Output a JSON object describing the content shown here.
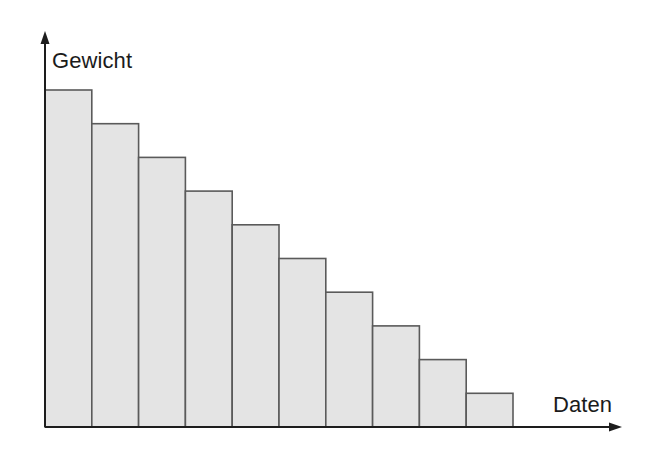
{
  "chart_data": {
    "type": "bar",
    "title": "",
    "subtitle": "",
    "xlabel": "Daten",
    "ylabel": "Gewicht",
    "categories": [
      "1",
      "2",
      "3",
      "4",
      "5",
      "6",
      "7",
      "8",
      "9",
      "10"
    ],
    "values": [
      10,
      9,
      8,
      7,
      6,
      5,
      4,
      3,
      2,
      1
    ],
    "series": [
      {
        "name": "Gewicht",
        "values": [
          10,
          9,
          8,
          7,
          6,
          5,
          4,
          3,
          2,
          1
        ]
      }
    ],
    "ylim": [
      0,
      10.9
    ],
    "xlim": [
      0,
      11.4
    ],
    "grid": false,
    "legend": false,
    "legend_position": "none",
    "tick_labels_x": [],
    "tick_labels_y": [],
    "annotations": [],
    "bar_fill_color": "#e4e4e4",
    "bar_edge_color": "#5a5a5a",
    "axis_color": "#1d1d1d",
    "background_color": "#ffffff"
  },
  "labels": {
    "y_axis_label": "Gewicht",
    "x_axis_label": "Daten"
  },
  "geometry": {
    "baseline_y": 427,
    "axis_x": 45,
    "bar_width": 46.8,
    "bar_top_first": 90,
    "bar_step": 33.2,
    "y_axis_top": 34,
    "x_axis_right": 620
  }
}
